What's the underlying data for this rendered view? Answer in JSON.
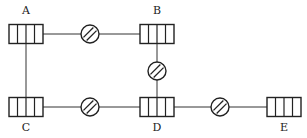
{
  "diagram": {
    "type": "network",
    "nodes": [
      {
        "id": "A",
        "label": "A",
        "x": 26,
        "y": 34,
        "label_y": 14
      },
      {
        "id": "B",
        "label": "B",
        "x": 157,
        "y": 34,
        "label_y": 14
      },
      {
        "id": "C",
        "label": "C",
        "x": 26,
        "y": 107,
        "label_y": 131
      },
      {
        "id": "D",
        "label": "D",
        "x": 157,
        "y": 107,
        "label_y": 131
      },
      {
        "id": "E",
        "label": "E",
        "x": 284,
        "y": 107,
        "label_y": 131
      }
    ],
    "edges": [
      {
        "from": "A",
        "to": "B",
        "has_valve": true,
        "valve": {
          "x": 90,
          "y": 34
        }
      },
      {
        "from": "B",
        "to": "D",
        "has_valve": true,
        "valve": {
          "x": 157,
          "y": 71
        }
      },
      {
        "from": "A",
        "to": "C",
        "has_valve": false
      },
      {
        "from": "C",
        "to": "D",
        "has_valve": true,
        "valve": {
          "x": 90,
          "y": 107
        }
      },
      {
        "from": "D",
        "to": "E",
        "has_valve": true,
        "valve": {
          "x": 220,
          "y": 107
        }
      }
    ],
    "node_style": {
      "width": 34,
      "height": 19,
      "cells": 4
    },
    "valve_style": {
      "radius": 9
    }
  }
}
